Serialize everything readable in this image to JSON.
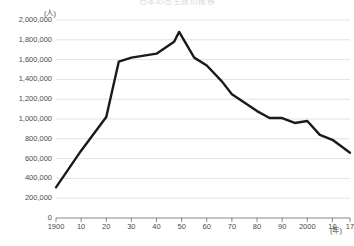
{
  "chart_data": {
    "type": "line",
    "title": "日本の出生数の推移",
    "xlabel": "(年)",
    "ylabel": "(人)",
    "ylim": [
      0,
      2000000
    ],
    "xlim": [
      1900,
      2017
    ],
    "grid": true,
    "legend": "none",
    "y_ticks": [
      "0",
      "200,000",
      "400,000",
      "600,000",
      "800,000",
      "1,000,000",
      "1,200,000",
      "1,400,000",
      "1,600,000",
      "1,800,000",
      "2,000,000"
    ],
    "y_tick_values": [
      0,
      200000,
      400000,
      600000,
      800000,
      1000000,
      1200000,
      1400000,
      1600000,
      1800000,
      2000000
    ],
    "x_ticks": [
      "1900",
      "10",
      "20",
      "30",
      "40",
      "50",
      "60",
      "70",
      "80",
      "90",
      "2000",
      "10",
      "17"
    ],
    "x_tick_values": [
      1900,
      1910,
      1920,
      1930,
      1940,
      1950,
      1960,
      1970,
      1980,
      1990,
      2000,
      2010,
      2017
    ],
    "series": [
      {
        "name": "出生数",
        "color": "#1a1a1a",
        "x": [
          1900,
          1910,
          1920,
          1925,
          1930,
          1940,
          1947,
          1949,
          1955,
          1960,
          1966,
          1970,
          1973,
          1980,
          1985,
          1990,
          1995,
          2000,
          2005,
          2010,
          2017
        ],
        "values": [
          310000,
          680000,
          1020000,
          1580000,
          1620000,
          1660000,
          1780000,
          1880000,
          1620000,
          1540000,
          1380000,
          1250000,
          1200000,
          1080000,
          1010000,
          1010000,
          960000,
          980000,
          840000,
          790000,
          660000
        ]
      }
    ]
  },
  "axis": {
    "y_unit": "(人)",
    "x_unit": "(年)"
  }
}
